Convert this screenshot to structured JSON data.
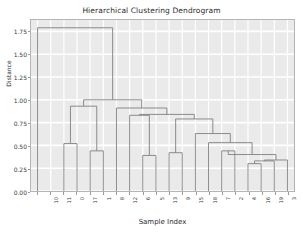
{
  "chart_data": {
    "type": "dendrogram",
    "title": "Hierarchical Clustering Dendrogram",
    "xlabel": "Sample Index",
    "ylabel": "Distance",
    "ylim": [
      0.0,
      1.875
    ],
    "yticks": [
      0.0,
      0.25,
      0.5,
      0.75,
      1.0,
      1.25,
      1.5,
      1.75
    ],
    "ytick_labels": [
      "0.00",
      "0.25",
      "0.50",
      "0.75",
      "1.00",
      "1.25",
      "1.50",
      "1.75"
    ],
    "grid": true,
    "legend": null,
    "leaf_count": 20,
    "leaf_labels": [
      "10",
      "11",
      "0",
      "17",
      "1",
      "8",
      "12",
      "6",
      "5",
      "13",
      "9",
      "15",
      "18",
      "7",
      "2",
      "4",
      "16",
      "19",
      "3",
      "14"
    ],
    "axes_facecolor": "#eaeaea",
    "link_color": "#808080",
    "links": [
      {
        "id": "n0",
        "left": "leaf:2",
        "right": "leaf:3",
        "height": 0.52
      },
      {
        "id": "n1",
        "left": "leaf:4",
        "right": "leaf:5",
        "height": 0.44
      },
      {
        "id": "n2",
        "left": "n0",
        "right": "n1",
        "height": 0.93
      },
      {
        "id": "n3",
        "left": "leaf:8",
        "right": "leaf:9",
        "height": 0.39
      },
      {
        "id": "n4",
        "left": "leaf:7",
        "right": "n3",
        "height": 0.83
      },
      {
        "id": "n5",
        "left": "leaf:10",
        "right": "leaf:11",
        "height": 0.42
      },
      {
        "id": "n6",
        "left": "leaf:14",
        "right": "leaf:15",
        "height": 0.44
      },
      {
        "id": "n7",
        "left": "leaf:16",
        "right": "leaf:17",
        "height": 0.3
      },
      {
        "id": "n8",
        "left": "n7",
        "right": "leaf:18",
        "height": 0.33
      },
      {
        "id": "n9",
        "left": "n8",
        "right": "leaf:19",
        "height": 0.34
      },
      {
        "id": "n10",
        "left": "n6",
        "right": "n9",
        "height": 0.4
      },
      {
        "id": "n11",
        "left": "leaf:13",
        "right": "n10",
        "height": 0.53
      },
      {
        "id": "n12",
        "left": "leaf:12",
        "right": "n11",
        "height": 0.63
      },
      {
        "id": "n13",
        "left": "n5",
        "right": "n12",
        "height": 0.79
      },
      {
        "id": "n14",
        "left": "n4",
        "right": "n13",
        "height": 0.84
      },
      {
        "id": "n15",
        "left": "leaf:6",
        "right": "n14",
        "height": 0.91
      },
      {
        "id": "n16",
        "left": "n2",
        "right": "n15",
        "height": 1.0
      },
      {
        "id": "n17",
        "left": "leaf:0",
        "right": "n16",
        "height": 1.79
      }
    ]
  }
}
